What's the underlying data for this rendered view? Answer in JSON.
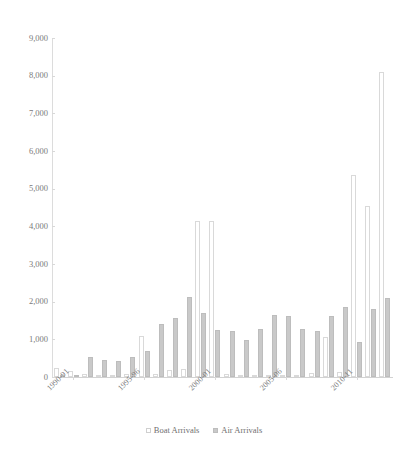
{
  "chart_data": {
    "type": "bar",
    "title": "",
    "xlabel": "",
    "ylabel": "",
    "ylim": [
      0,
      9000
    ],
    "ytick_step": 1000,
    "ytick_labels": [
      "9,000",
      "8,000",
      "7,000",
      "6,000",
      "5,000",
      "4,000",
      "3,000",
      "2,000",
      "1,000",
      "0"
    ],
    "ytick_values": [
      9000,
      8000,
      7000,
      6000,
      5000,
      4000,
      3000,
      2000,
      1000,
      0
    ],
    "grid": false,
    "legend_position": "bottom",
    "categories": [
      "1989-90",
      "1990-91",
      "1991-92",
      "1992-93",
      "1993-94",
      "1994-95",
      "1995-96",
      "1996-97",
      "1997-98",
      "1998-99",
      "1999-00",
      "2000-01",
      "2001-02",
      "2002-03",
      "2003-04",
      "2004-05",
      "2005-06",
      "2006-07",
      "2007-08",
      "2008-09",
      "2009-10",
      "2010-11",
      "2011-12",
      "2012-13"
    ],
    "xtick_labels": [
      "1990-91",
      "1995-96",
      "2000-01",
      "2005-06",
      "2010-11"
    ],
    "xtick_category_index": [
      1,
      6,
      11,
      16,
      21
    ],
    "series": [
      {
        "name": "Boat Arrivals",
        "color": "#ffffff",
        "edge_color": "#d9d9d9",
        "values": [
          250,
          160,
          80,
          30,
          40,
          70,
          1090,
          80,
          180,
          200,
          4150,
          4140,
          80,
          30,
          20,
          20,
          30,
          60,
          100,
          1050,
          130,
          5350,
          4550,
          8100
        ]
      },
      {
        "name": "Air Arrivals",
        "color": "#c9c9c9",
        "edge_color": "#bdbdbd",
        "values": [
          60,
          40,
          540,
          460,
          420,
          520,
          700,
          1420,
          1580,
          2130,
          1700,
          1240,
          1220,
          990,
          1270,
          1650,
          1630,
          1280,
          1220,
          1630,
          1860,
          930,
          1800,
          2090
        ]
      }
    ]
  },
  "legend": {
    "entries": [
      {
        "label": "Boat Arrivals",
        "swatch": "boat"
      },
      {
        "label": "Air Arrivals",
        "swatch": "air"
      }
    ]
  }
}
